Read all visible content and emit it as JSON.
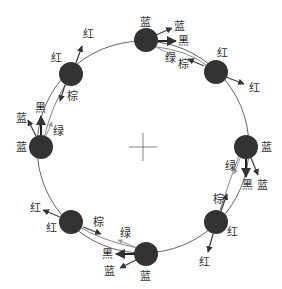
{
  "diagram": {
    "type": "ring-of-nodes",
    "center_marker": "crosshair",
    "colors": {
      "node": "#333333",
      "ring": "#555555",
      "text": "#333333"
    },
    "nodes": [
      {
        "id": "n1",
        "position": "top",
        "label": "蓝",
        "arrows": [
          "蓝",
          "黑",
          "绿",
          "棕"
        ]
      },
      {
        "id": "n2",
        "position": "top-right",
        "label": "红",
        "arrows": [
          "红"
        ]
      },
      {
        "id": "n3",
        "position": "right",
        "label": "蓝",
        "arrows": [
          "绿",
          "黑",
          "蓝"
        ]
      },
      {
        "id": "n4",
        "position": "bottom-right",
        "label": "红",
        "arrows": [
          "棕",
          "红"
        ]
      },
      {
        "id": "n5",
        "position": "bottom",
        "label": "蓝",
        "arrows": [
          "黑",
          "蓝",
          "绿"
        ]
      },
      {
        "id": "n6",
        "position": "bottom-left",
        "label": "红",
        "arrows": [
          "红",
          "棕"
        ]
      },
      {
        "id": "n7",
        "position": "left",
        "label": "蓝",
        "arrows": [
          "蓝",
          "黑",
          "绿"
        ]
      },
      {
        "id": "n8",
        "position": "top-left",
        "label": "红",
        "arrows": [
          "红",
          "棕"
        ]
      }
    ],
    "labels": {
      "n1_node": "蓝",
      "n1_a_blue": "蓝",
      "n1_a_black": "黑",
      "n1_a_green": "绿",
      "n1_a_brown": "棕",
      "n2_node": "红",
      "n2_a_red": "红",
      "n3_node": "蓝",
      "n3_a_green": "绿",
      "n3_a_black": "黑",
      "n3_a_blue": "蓝",
      "n4_node": "红",
      "n4_a_brown": "棕",
      "n4_a_red": "红",
      "n5_node": "蓝",
      "n5_a_black": "黑",
      "n5_a_blue": "蓝",
      "n5_a_green": "绿",
      "n6_node": "红",
      "n6_a_red": "红",
      "n6_a_brown": "棕",
      "n7_node": "蓝",
      "n7_a_blue": "蓝",
      "n7_a_black": "黑",
      "n7_a_green": "绿",
      "n8_node": "红",
      "n8_a_red": "红",
      "n8_a_brown": "棕"
    }
  }
}
